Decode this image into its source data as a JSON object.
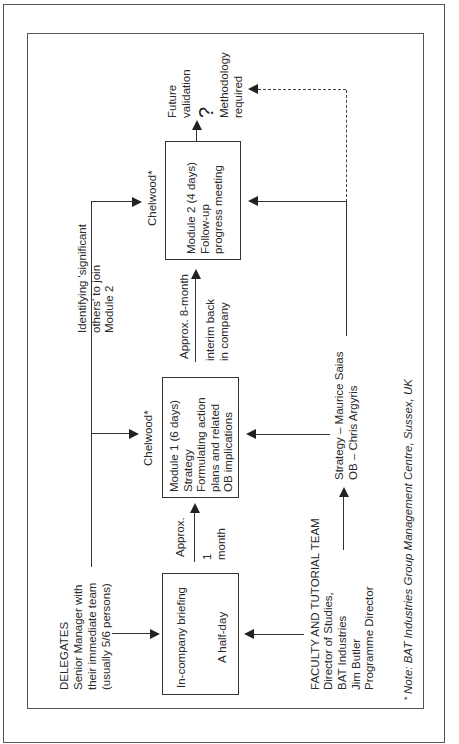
{
  "figure": {
    "orientation": "rotated-90-ccw",
    "colors": {
      "line": "#333333",
      "text": "#2a2a2a",
      "background": "#ffffff"
    }
  },
  "delegates": {
    "heading": "DELEGATES",
    "line1": "Senior Manager with",
    "line2": "their immediate team",
    "line3": "(usually 5/6 persons)"
  },
  "briefing_box": {
    "title": "In-company briefing",
    "duration": "A half-day"
  },
  "gap1": {
    "label_top": "Approx.",
    "label_bottom": "1\nmonth"
  },
  "module1": {
    "venue": "Chelwood*",
    "line1": "Module 1 (6 days)",
    "line2": "Strategy",
    "line3": "Formulating action",
    "line4": "plans and related",
    "line5": "OB implications"
  },
  "gap2": {
    "label_top": "Approx. 8-month",
    "label_bottom": "interim back\nin company"
  },
  "significant_others": {
    "text": "Identifying 'significant\nothers' to join\nModule 2"
  },
  "module2": {
    "venue": "Chelwood*",
    "line1": "Module 2 (4 days)",
    "line2": "Follow-up",
    "line3": "progress meeting"
  },
  "future": {
    "validation": "Future\nvalidation",
    "question_mark": "?",
    "methodology": "Methodology\nrequired"
  },
  "faculty": {
    "heading": "FACULTY AND TUTORIAL TEAM",
    "line1": "Director of Studies,",
    "line2": "BAT Industries",
    "line3": "Jim Butler",
    "line4": "Programme Director"
  },
  "speakers": {
    "text": "Strategy – Maurice Saias\nOB – Chris Argyris"
  },
  "note": {
    "asterisk": "*",
    "text": "Note: BAT Industries Group Management Centre, Sussex, UK"
  }
}
